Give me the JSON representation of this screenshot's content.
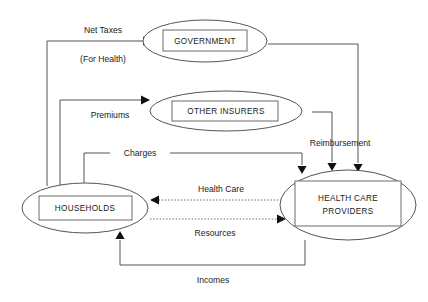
{
  "diagram": {
    "nodes": [
      {
        "id": "government",
        "label": "GOVERNMENT"
      },
      {
        "id": "other_insurers",
        "label": "OTHER INSURERS"
      },
      {
        "id": "households",
        "label": "HOUSEHOLDS"
      },
      {
        "id": "providers",
        "label_line1": "HEALTH CARE",
        "label_line2": "PROVIDERS"
      }
    ],
    "edges": [
      {
        "id": "net_taxes",
        "label": "Net Taxes",
        "sublabel": "(For Health)",
        "from": "households",
        "to": "government",
        "style": "solid"
      },
      {
        "id": "premiums",
        "label": "Premiums",
        "from": "households",
        "to": "other_insurers",
        "style": "solid"
      },
      {
        "id": "charges",
        "label": "Charges",
        "from": "households",
        "to": "providers",
        "style": "solid"
      },
      {
        "id": "reimbursement",
        "label": "Reimbursement",
        "from": "government",
        "to": "providers",
        "style": "solid"
      },
      {
        "id": "health_care",
        "label": "Health Care",
        "from": "providers",
        "to": "households",
        "style": "dotted"
      },
      {
        "id": "resources",
        "label": "Resources",
        "from": "households",
        "to": "providers",
        "style": "dotted"
      },
      {
        "id": "incomes",
        "label": "Incomes",
        "from": "providers",
        "to": "households",
        "style": "solid"
      }
    ],
    "colors": {
      "background": "#ffffff",
      "stroke": "#555555",
      "text": "#1a1a1a",
      "arrow": "#111111"
    }
  }
}
